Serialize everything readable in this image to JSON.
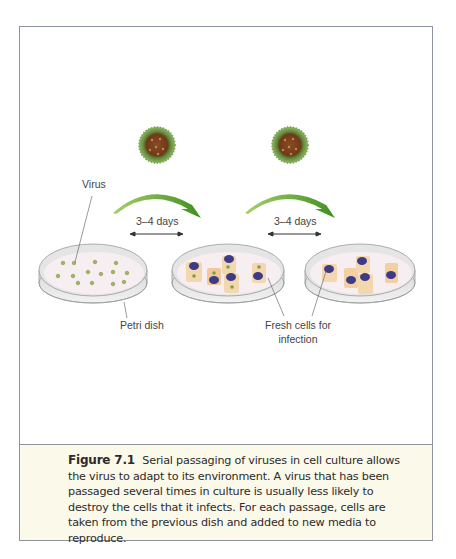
{
  "figure": {
    "labels": {
      "virus": "Virus",
      "petri_dish": "Petri dish",
      "fresh_cells_line1": "Fresh cells for",
      "fresh_cells_line2": "infection",
      "interval_1": "3–4 days",
      "interval_2": "3–4 days"
    },
    "icons": [
      "virus-particle-icon",
      "curved-arrow-icon",
      "double-arrow-icon",
      "petri-dish-icon",
      "cell-icon"
    ],
    "colors": {
      "arrow_green": "#5aa02c",
      "virus_green": "#6e9a45",
      "virus_core": "#7a3d1c",
      "cell_tan": "#f3d2a8",
      "nucleus_purple": "#3d3a86",
      "caption_bg": "#fbf9ea",
      "frame_border": "#8d93a3"
    }
  },
  "caption": {
    "figure_number": "Figure 7.1",
    "text": "Serial passaging of viruses in cell culture allows the virus to adapt to its environment. A virus that has been passaged several times in culture is usually less likely to destroy the cells that it infects. For each passage, cells are taken from the previous dish and added to new media to reproduce."
  }
}
